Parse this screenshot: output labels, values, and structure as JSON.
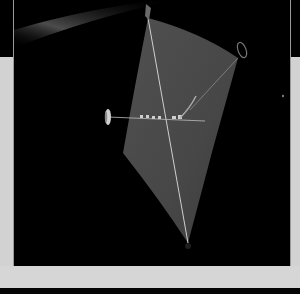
{
  "figure": {
    "caption": "",
    "colors": {
      "space": "#000000",
      "sail": "#4a4a4a",
      "sail_dark": "#3a3a3a",
      "boom": "#d8d8d8",
      "border": "#d2d2d2",
      "streak": "#8a8a8a"
    }
  }
}
